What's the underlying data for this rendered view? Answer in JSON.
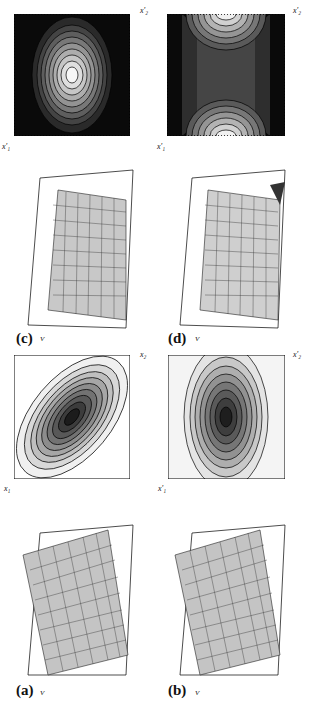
{
  "figure": {
    "panels": [
      {
        "id": "a",
        "label": "(a)",
        "contour_type": "tilted-ellipse-dark-center",
        "x1_label": "x₁",
        "x2_label": "x₂"
      },
      {
        "id": "b",
        "label": "(b)",
        "contour_type": "ellipse-dark-center",
        "x1_label": "x′₁",
        "x2_label": "x′₂"
      },
      {
        "id": "c",
        "label": "(c)",
        "contour_type": "ellipse-bright-center",
        "x1_label": "x′₁",
        "x2_label": "x′₂"
      },
      {
        "id": "d",
        "label": "(d)",
        "contour_type": "saddle",
        "x1_label": "x′₁",
        "x2_label": "x′₂"
      }
    ],
    "v_axis": {
      "label": "V",
      "ticks": [
        "1",
        "0.75",
        "0.5",
        "0.25",
        "0"
      ]
    },
    "xy_ticks": [
      "−4",
      "−2",
      "0",
      "2",
      "4"
    ],
    "contour_ticks_x": [
      "−4",
      "−2",
      "0",
      "2",
      "4"
    ],
    "contour_ticks_y": [
      "4",
      "2",
      "0",
      "−2",
      "−4"
    ]
  }
}
